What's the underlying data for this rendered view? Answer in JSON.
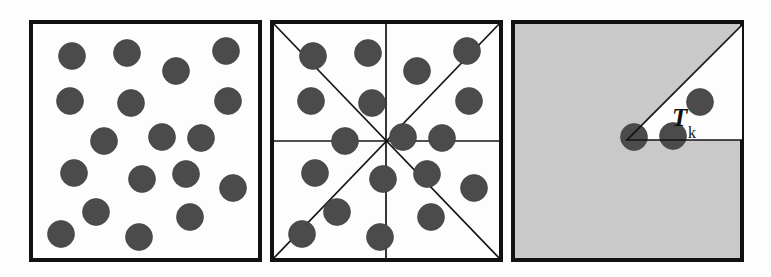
{
  "figure": {
    "background_color": "#fdfdfd",
    "border_color": "#111111",
    "dot_color": "#4b4b4b",
    "gray_fill_color": "#c9c9c9",
    "dot_radius": 13.5
  },
  "panels": [
    {
      "id": "panel-points",
      "name": "point-pattern-panel",
      "box": {
        "x": 31,
        "y": 22,
        "w": 229,
        "h": 238
      },
      "fill": "#fdfdfd",
      "has_sectors": false,
      "points": [
        {
          "cx": 72,
          "cy": 56
        },
        {
          "cx": 127,
          "cy": 53
        },
        {
          "cx": 176,
          "cy": 71
        },
        {
          "cx": 226,
          "cy": 51
        },
        {
          "cx": 70,
          "cy": 101
        },
        {
          "cx": 131,
          "cy": 103
        },
        {
          "cx": 228,
          "cy": 101
        },
        {
          "cx": 104,
          "cy": 141
        },
        {
          "cx": 162,
          "cy": 137
        },
        {
          "cx": 201,
          "cy": 138
        },
        {
          "cx": 74,
          "cy": 173
        },
        {
          "cx": 142,
          "cy": 179
        },
        {
          "cx": 186,
          "cy": 174
        },
        {
          "cx": 233,
          "cy": 188
        },
        {
          "cx": 96,
          "cy": 212
        },
        {
          "cx": 190,
          "cy": 217
        },
        {
          "cx": 61,
          "cy": 234
        },
        {
          "cx": 139,
          "cy": 237
        }
      ]
    },
    {
      "id": "panel-sectors",
      "name": "sector-overlay-panel",
      "box": {
        "x": 272,
        "y": 22,
        "w": 229,
        "h": 238
      },
      "fill": "#fdfdfd",
      "has_sectors": true,
      "sector_center": {
        "x": 386,
        "y": 141
      },
      "sector_count": 8,
      "points": [
        {
          "cx": 313,
          "cy": 56
        },
        {
          "cx": 368,
          "cy": 53
        },
        {
          "cx": 417,
          "cy": 71
        },
        {
          "cx": 467,
          "cy": 51
        },
        {
          "cx": 311,
          "cy": 101
        },
        {
          "cx": 372,
          "cy": 103
        },
        {
          "cx": 469,
          "cy": 101
        },
        {
          "cx": 345,
          "cy": 141
        },
        {
          "cx": 403,
          "cy": 137
        },
        {
          "cx": 442,
          "cy": 138
        },
        {
          "cx": 315,
          "cy": 173
        },
        {
          "cx": 383,
          "cy": 179
        },
        {
          "cx": 427,
          "cy": 174
        },
        {
          "cx": 474,
          "cy": 188
        },
        {
          "cx": 337,
          "cy": 212
        },
        {
          "cx": 431,
          "cy": 217
        },
        {
          "cx": 302,
          "cy": 234
        },
        {
          "cx": 380,
          "cy": 237
        }
      ]
    },
    {
      "id": "panel-wedge",
      "name": "highlighted-wedge-panel",
      "box": {
        "x": 513,
        "y": 22,
        "w": 229,
        "h": 238
      },
      "fill": "#c9c9c9",
      "has_sectors": false,
      "wedge": {
        "apex": {
          "x": 627,
          "y": 140
        },
        "corner": {
          "x": 742,
          "y": 25
        },
        "base_end": {
          "x": 742,
          "y": 140
        },
        "fill": "#fdfdfd"
      },
      "label": {
        "text": "T",
        "subscript": "k",
        "x": 672,
        "y": 126
      },
      "points": [
        {
          "cx": 700,
          "cy": 102
        },
        {
          "cx": 673,
          "cy": 136
        },
        {
          "cx": 634,
          "cy": 137
        }
      ]
    }
  ]
}
